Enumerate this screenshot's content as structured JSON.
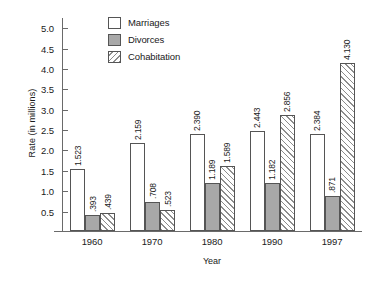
{
  "chart_data": {
    "type": "bar",
    "title": "",
    "xlabel": "Year",
    "ylabel": "Rate (in millions)",
    "categories": [
      "1960",
      "1970",
      "1980",
      "1990",
      "1997"
    ],
    "ylim": [
      0,
      5.0
    ],
    "yticks": [
      "0.5",
      "1.0",
      "1.5",
      "2.0",
      "2.5",
      "3.0",
      "3.5",
      "4.0",
      "4.5",
      "5.0"
    ],
    "ytick_values": [
      0.5,
      1.0,
      1.5,
      2.0,
      2.5,
      3.0,
      3.5,
      4.0,
      4.5,
      5.0
    ],
    "grid": false,
    "legend_position": "top-center",
    "series": [
      {
        "name": "Marriages",
        "style": "open",
        "color": "#ffffff",
        "values": [
          1.523,
          2.159,
          2.39,
          2.443,
          2.384
        ],
        "labels": [
          "1.523",
          "2.159",
          "2.390",
          "2.443",
          "2.384"
        ]
      },
      {
        "name": "Divorces",
        "style": "solid-gray",
        "color": "#a8a8a8",
        "values": [
          0.393,
          0.708,
          1.189,
          1.182,
          0.871
        ],
        "labels": [
          ".393",
          ".708",
          "1.189",
          "1.182",
          ".871"
        ]
      },
      {
        "name": "Cohabitation",
        "style": "diagonal-hatch",
        "color": "#8d8d8d",
        "values": [
          0.439,
          0.523,
          1.589,
          2.856,
          4.13
        ],
        "labels": [
          ".439",
          ".523",
          "1.589",
          "2.856",
          "4.130"
        ]
      }
    ]
  }
}
